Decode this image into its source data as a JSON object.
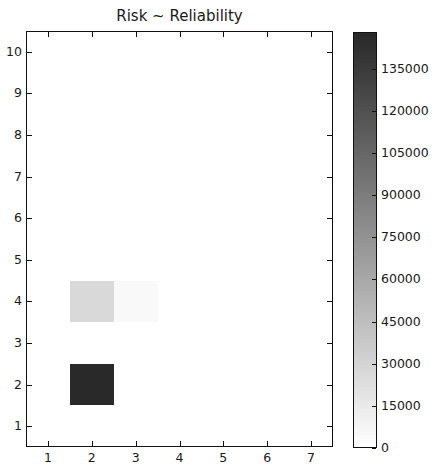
{
  "chart_data": {
    "type": "heatmap",
    "title": "Risk ~ Reliability",
    "xlabel": "",
    "ylabel": "",
    "xlim": [
      0.5,
      7.5
    ],
    "ylim": [
      0.5,
      10.5
    ],
    "x_ticks": [
      1,
      2,
      3,
      4,
      5,
      6,
      7
    ],
    "y_ticks": [
      1,
      2,
      3,
      4,
      5,
      6,
      7,
      8,
      9,
      10
    ],
    "colormap": "gray_r",
    "grid": false,
    "cells": [
      {
        "x": 2,
        "y": 2,
        "value": 147000
      },
      {
        "x": 2,
        "y": 4,
        "value": 26000
      },
      {
        "x": 3,
        "y": 4,
        "value": 4000
      }
    ],
    "other_cells_value": 0,
    "colorbar": {
      "position": "right",
      "range": [
        0,
        148000
      ],
      "ticks": [
        0,
        15000,
        30000,
        45000,
        60000,
        75000,
        90000,
        105000,
        120000,
        135000
      ]
    }
  }
}
